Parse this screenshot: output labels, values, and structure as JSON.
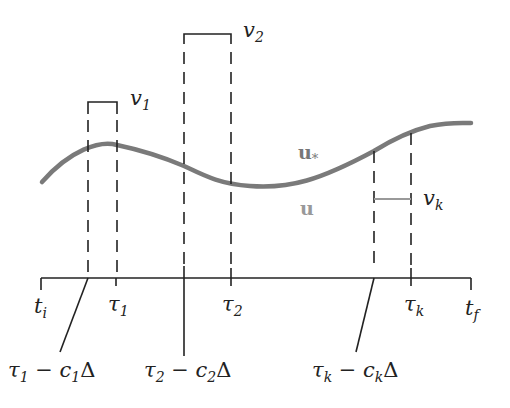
{
  "diagram": {
    "type": "timing-diagram",
    "colors": {
      "ink": "#222222",
      "curve": "#777777",
      "u_label": "#999999",
      "u_star_label": "#777777",
      "vk_pulse": "#999999"
    },
    "curve_labels": {
      "u_star": {
        "base": "u",
        "sub": "*"
      },
      "u": {
        "base": "u"
      }
    },
    "pulses": [
      {
        "name": "v",
        "sub": "1"
      },
      {
        "name": "v",
        "sub": "2"
      },
      {
        "name": "v",
        "sub": "k"
      }
    ],
    "axis_ticks": [
      {
        "base": "t",
        "sub": "i"
      },
      {
        "base": "τ",
        "sub": "1"
      },
      {
        "base": "τ",
        "sub": "2"
      },
      {
        "base": "τ",
        "sub": "k"
      },
      {
        "base": "t",
        "sub": "f"
      }
    ],
    "callouts": [
      {
        "tau": "τ",
        "tau_sub": "1",
        "minus": " − ",
        "c": "c",
        "c_sub": "1",
        "delta": "Δ"
      },
      {
        "tau": "τ",
        "tau_sub": "2",
        "minus": " − ",
        "c": "c",
        "c_sub": "2",
        "delta": "Δ"
      },
      {
        "tau": "τ",
        "tau_sub": "k",
        "minus": " − ",
        "c": "c",
        "c_sub": "k",
        "delta": "Δ"
      }
    ]
  }
}
